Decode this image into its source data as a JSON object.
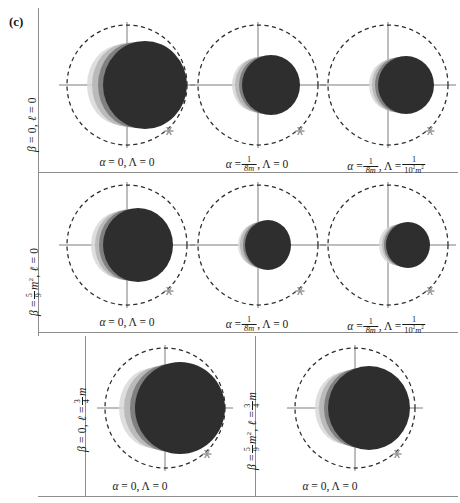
{
  "figure": {
    "tag": "(c)",
    "type": "black-hole-shadow-grid"
  },
  "rows": [
    {
      "id": "row-1",
      "label_plain": "β = 0, ℓ = 0",
      "label_parts": {
        "beta": "β",
        "eq1": "= 0,",
        "ell": "ℓ",
        "eq2": "= 0"
      }
    },
    {
      "id": "row-2",
      "label_plain": "β = 5/9 m², ℓ = 0",
      "label_parts": {
        "beta": "β",
        "eq": "=",
        "num": "5",
        "den": "9",
        "m": "m",
        "exp": "2",
        "comma": ",",
        "ell": "ℓ",
        "eq2": "= 0"
      }
    },
    {
      "id": "row-3-left",
      "label_plain": "β = 0, ℓ = 3/4 m",
      "label_parts": {
        "beta": "β",
        "eq1": "= 0,",
        "ell": "ℓ",
        "eq2": "=",
        "num": "3",
        "den": "4",
        "m": "m"
      }
    },
    {
      "id": "row-3-right",
      "label_plain": "β = 5/9 m², ℓ = 3/4 m",
      "label_parts": {
        "beta": "β",
        "eq": "=",
        "num": "5",
        "den": "9",
        "m": "m",
        "exp": "2",
        "comma": ",",
        "ell": "ℓ",
        "eq2": "=",
        "num2": "3",
        "den2": "4",
        "m2": "m"
      }
    }
  ],
  "captions": [
    {
      "id": "cap-r1c1",
      "plain": "α = 0, Λ = 0",
      "parts": {
        "alpha": "α",
        "eq1": "= 0,",
        "lambda": "Λ",
        "eq2": "= 0"
      },
      "kind": "simple"
    },
    {
      "id": "cap-r1c2",
      "plain": "α = 1/8m, Λ = 0",
      "parts": {
        "alpha": "α",
        "eq1": "=",
        "num": "1",
        "den": "8m",
        "comma": ",",
        "lambda": "Λ",
        "eq2": "= 0"
      },
      "kind": "alpha-frac"
    },
    {
      "id": "cap-r1c3",
      "plain": "α = 1/8m, Λ = 1/10² m²",
      "parts": {
        "alpha": "α",
        "eq1": "=",
        "num": "1",
        "den": "8m",
        "comma": ",",
        "lambda": "Λ",
        "eq2": "=",
        "num2": "1",
        "den2": "10",
        "den2exp": "2",
        "den2m": "m",
        "den2mexp": "2"
      },
      "kind": "both-frac"
    },
    {
      "id": "cap-r2c1",
      "plain": "α = 0, Λ = 0",
      "parts": {
        "alpha": "α",
        "eq1": "= 0,",
        "lambda": "Λ",
        "eq2": "= 0"
      },
      "kind": "simple"
    },
    {
      "id": "cap-r2c2",
      "plain": "α = 1/8m, Λ = 0",
      "parts": {
        "alpha": "α",
        "eq1": "=",
        "num": "1",
        "den": "8m",
        "comma": ",",
        "lambda": "Λ",
        "eq2": "= 0"
      },
      "kind": "alpha-frac"
    },
    {
      "id": "cap-r2c3",
      "plain": "α = 1/8m, Λ = 1/10² m²",
      "parts": {
        "alpha": "α",
        "eq1": "=",
        "num": "1",
        "den": "8m",
        "comma": ",",
        "lambda": "Λ",
        "eq2": "=",
        "num2": "1",
        "den2": "10",
        "den2exp": "2",
        "den2m": "m",
        "den2mexp": "2"
      },
      "kind": "both-frac"
    },
    {
      "id": "cap-r3c1",
      "plain": "α = 0, Λ = 0",
      "parts": {
        "alpha": "α",
        "eq1": "= 0,",
        "lambda": "Λ",
        "eq2": "= 0"
      },
      "kind": "simple"
    },
    {
      "id": "cap-r3c2",
      "plain": "α = 0, Λ = 0",
      "parts": {
        "alpha": "α",
        "eq1": "= 0,",
        "lambda": "Λ",
        "eq2": "= 0"
      },
      "kind": "simple"
    }
  ],
  "colors": {
    "shadow_dark": "#2e2e2e",
    "shadow_mid": "#6d6d6d",
    "shadow_light": "#b4b4b4",
    "shadow_faint": "#d8d8d8",
    "ref_circle": "#2b2b2b",
    "axis": "#6e6e6e",
    "rule": "#8d8d8d",
    "star": "#9a9a9a",
    "background": "#ffffff"
  },
  "panels": [
    {
      "id": "panel-r1c1",
      "row": 1,
      "col": 1,
      "ref_radius": 60,
      "disks": [
        {
          "cx": -6,
          "cy": 0,
          "rx": 34,
          "ry": 40,
          "color": "#d8d8d8",
          "opacity": 0.85
        },
        {
          "cx": 1,
          "cy": 0,
          "rx": 36,
          "ry": 42,
          "color": "#b4b4b4",
          "opacity": 0.85
        },
        {
          "cx": 9,
          "cy": 0,
          "rx": 38,
          "ry": 43,
          "color": "#7a7a7a",
          "opacity": 0.9
        },
        {
          "cx": 18,
          "cy": 0,
          "rx": 42,
          "ry": 44,
          "color": "#2e2e2e",
          "opacity": 1.0
        }
      ],
      "star": {
        "x": 42,
        "y": 46
      }
    },
    {
      "id": "panel-r1c2",
      "row": 1,
      "col": 2,
      "ref_radius": 60,
      "disks": [
        {
          "cx": -4,
          "cy": 0,
          "rx": 22,
          "ry": 26,
          "color": "#d8d8d8",
          "opacity": 0.85
        },
        {
          "cx": 1,
          "cy": 0,
          "rx": 24,
          "ry": 28,
          "color": "#b4b4b4",
          "opacity": 0.85
        },
        {
          "cx": 7,
          "cy": 0,
          "rx": 26,
          "ry": 29,
          "color": "#7a7a7a",
          "opacity": 0.9
        },
        {
          "cx": 13,
          "cy": 0,
          "rx": 29,
          "ry": 30,
          "color": "#2e2e2e",
          "opacity": 1.0
        }
      ],
      "star": {
        "x": 42,
        "y": 46
      }
    },
    {
      "id": "panel-r1c3",
      "row": 1,
      "col": 3,
      "ref_radius": 60,
      "disks": [
        {
          "cx": 2,
          "cy": 0,
          "rx": 21,
          "ry": 25,
          "color": "#d8d8d8",
          "opacity": 0.85
        },
        {
          "cx": 7,
          "cy": 0,
          "rx": 23,
          "ry": 27,
          "color": "#b4b4b4",
          "opacity": 0.85
        },
        {
          "cx": 12,
          "cy": 0,
          "rx": 25,
          "ry": 28,
          "color": "#7a7a7a",
          "opacity": 0.9
        },
        {
          "cx": 18,
          "cy": 0,
          "rx": 28,
          "ry": 29,
          "color": "#2e2e2e",
          "opacity": 1.0
        }
      ],
      "star": {
        "x": 42,
        "y": 46
      }
    },
    {
      "id": "panel-r2c1",
      "row": 2,
      "col": 1,
      "ref_radius": 60,
      "disks": [
        {
          "cx": -8,
          "cy": 0,
          "rx": 28,
          "ry": 33,
          "color": "#d8d8d8",
          "opacity": 0.85
        },
        {
          "cx": -2,
          "cy": 0,
          "rx": 30,
          "ry": 35,
          "color": "#b4b4b4",
          "opacity": 0.85
        },
        {
          "cx": 4,
          "cy": 0,
          "rx": 32,
          "ry": 36,
          "color": "#7a7a7a",
          "opacity": 0.9
        },
        {
          "cx": 11,
          "cy": 0,
          "rx": 35,
          "ry": 37,
          "color": "#2e2e2e",
          "opacity": 1.0
        }
      ],
      "star": {
        "x": 42,
        "y": 46
      }
    },
    {
      "id": "panel-r2c2",
      "row": 2,
      "col": 2,
      "ref_radius": 60,
      "disks": [
        {
          "cx": -2,
          "cy": 0,
          "rx": 18,
          "ry": 21,
          "color": "#d8d8d8",
          "opacity": 0.85
        },
        {
          "cx": 2,
          "cy": 0,
          "rx": 20,
          "ry": 23,
          "color": "#b4b4b4",
          "opacity": 0.85
        },
        {
          "cx": 6,
          "cy": 0,
          "rx": 21,
          "ry": 24,
          "color": "#7a7a7a",
          "opacity": 0.9
        },
        {
          "cx": 10,
          "cy": 0,
          "rx": 23,
          "ry": 25,
          "color": "#2e2e2e",
          "opacity": 1.0
        }
      ],
      "star": {
        "x": 42,
        "y": 46
      }
    },
    {
      "id": "panel-r2c3",
      "row": 2,
      "col": 3,
      "ref_radius": 60,
      "disks": [
        {
          "cx": 8,
          "cy": 0,
          "rx": 17,
          "ry": 20,
          "color": "#d8d8d8",
          "opacity": 0.85
        },
        {
          "cx": 12,
          "cy": 0,
          "rx": 18,
          "ry": 21,
          "color": "#b4b4b4",
          "opacity": 0.85
        },
        {
          "cx": 16,
          "cy": 0,
          "rx": 20,
          "ry": 22,
          "color": "#7a7a7a",
          "opacity": 0.9
        },
        {
          "cx": 20,
          "cy": 0,
          "rx": 22,
          "ry": 23,
          "color": "#2e2e2e",
          "opacity": 1.0
        }
      ],
      "star": {
        "x": 42,
        "y": 46
      }
    },
    {
      "id": "panel-r3c1",
      "row": 3,
      "col": 1,
      "ref_radius": 60,
      "disks": [
        {
          "cx": -12,
          "cy": 0,
          "rx": 34,
          "ry": 40,
          "color": "#d8d8d8",
          "opacity": 0.85
        },
        {
          "cx": -4,
          "cy": 0,
          "rx": 37,
          "ry": 42,
          "color": "#b4b4b4",
          "opacity": 0.85
        },
        {
          "cx": 5,
          "cy": 0,
          "rx": 40,
          "ry": 44,
          "color": "#7a7a7a",
          "opacity": 0.9
        },
        {
          "cx": 15,
          "cy": 0,
          "rx": 45,
          "ry": 46,
          "color": "#2e2e2e",
          "opacity": 1.0
        }
      ],
      "star": {
        "x": 42,
        "y": 46
      }
    },
    {
      "id": "panel-r3c2",
      "row": 3,
      "col": 2,
      "ref_radius": 60,
      "disks": [
        {
          "cx": -10,
          "cy": 0,
          "rx": 30,
          "ry": 36,
          "color": "#d8d8d8",
          "opacity": 0.85
        },
        {
          "cx": -3,
          "cy": 0,
          "rx": 33,
          "ry": 38,
          "color": "#b4b4b4",
          "opacity": 0.85
        },
        {
          "cx": 5,
          "cy": 0,
          "rx": 36,
          "ry": 40,
          "color": "#7a7a7a",
          "opacity": 0.9
        },
        {
          "cx": 14,
          "cy": 0,
          "rx": 41,
          "ry": 42,
          "color": "#2e2e2e",
          "opacity": 1.0
        }
      ],
      "star": {
        "x": 42,
        "y": 46
      }
    }
  ]
}
